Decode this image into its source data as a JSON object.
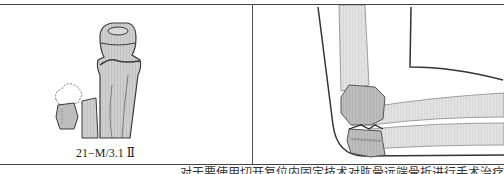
{
  "figure": {
    "left_panel": {
      "label": "21−M/3.1 Ⅱ",
      "illustration": "bone-fracture-diagram"
    },
    "right_panel": {
      "illustration": "elbow-fracture-illustration"
    },
    "caption": "对于要使用切开复位内固定技术对肱骨远端骨折进行手术治疗"
  },
  "colors": {
    "rule": "#444444",
    "bone_fill": "#c8c8c8",
    "bone_stroke": "#3a3a3a",
    "skin_stroke": "#333333",
    "arm_fill": "#e6e6e6"
  }
}
